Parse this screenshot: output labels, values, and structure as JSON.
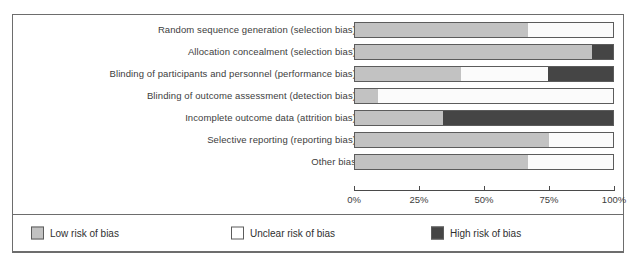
{
  "chart_data": {
    "type": "bar",
    "orientation": "horizontal",
    "stacked": true,
    "normalized": true,
    "title": "",
    "xlabel": "",
    "ylabel": "",
    "xlim": [
      0,
      100
    ],
    "grid": false,
    "legend_position": "bottom",
    "x_tick_labels": [
      "0%",
      "25%",
      "50%",
      "75%",
      "100%"
    ],
    "x_tick_values": [
      0,
      25,
      50,
      75,
      100
    ],
    "categories": [
      "Random sequence generation (selection bias)",
      "Allocation concealment (selection bias)",
      "Blinding of participants and personnel (performance bias)",
      "Blinding of outcome assessment (detection bias)",
      "Incomplete outcome data (attrition bias)",
      "Selective reporting (reporting bias)",
      "Other bias"
    ],
    "series": [
      {
        "name": "Low risk of bias",
        "color": "#c2c2c2",
        "values": [
          67,
          92,
          41,
          9,
          34,
          75,
          67
        ]
      },
      {
        "name": "Unclear risk of bias",
        "color": "#ffffff",
        "values": [
          33,
          0,
          34,
          91,
          0,
          25,
          33
        ]
      },
      {
        "name": "High risk of bias",
        "color": "#454545",
        "values": [
          0,
          8,
          25,
          0,
          66,
          0,
          0
        ]
      }
    ]
  },
  "rows": [
    {
      "label": "Random sequence generation (selection bias)",
      "low": 67,
      "unclear": 33,
      "high": 0
    },
    {
      "label": "Allocation concealment (selection bias)",
      "low": 92,
      "unclear": 0,
      "high": 8
    },
    {
      "label": "Blinding of participants and personnel (performance bias)",
      "low": 41,
      "unclear": 34,
      "high": 25
    },
    {
      "label": "Blinding of outcome assessment (detection bias)",
      "low": 9,
      "unclear": 91,
      "high": 0
    },
    {
      "label": "Incomplete outcome data (attrition bias)",
      "low": 34,
      "unclear": 0,
      "high": 66
    },
    {
      "label": "Selective reporting (reporting bias)",
      "low": 75,
      "unclear": 25,
      "high": 0
    },
    {
      "label": "Other bias",
      "low": 67,
      "unclear": 33,
      "high": 0
    }
  ],
  "axis": {
    "ticks": [
      {
        "label": "0%",
        "value": 0
      },
      {
        "label": "25%",
        "value": 25
      },
      {
        "label": "50%",
        "value": 50
      },
      {
        "label": "75%",
        "value": 75
      },
      {
        "label": "100%",
        "value": 100
      }
    ]
  },
  "legend": {
    "items": [
      {
        "label": "Low risk of bias",
        "color": "#c2c2c2",
        "key": "low"
      },
      {
        "label": "Unclear risk of bias",
        "color": "#ffffff",
        "key": "unclear"
      },
      {
        "label": "High risk of bias",
        "color": "#454545",
        "key": "high"
      }
    ]
  }
}
